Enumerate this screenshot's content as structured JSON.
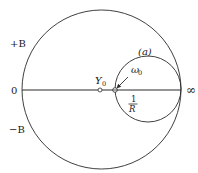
{
  "diagram": {
    "colors": {
      "stroke": "#2a2a2a",
      "text": "#1a1a1a",
      "background": "#ffffff"
    },
    "outer_circle": {
      "cx": 101.5,
      "cy": 89.5,
      "r": 79.5
    },
    "inner_circle": {
      "cx": 148,
      "cy": 89,
      "r": 33,
      "label": "(a)"
    },
    "axis": {
      "x1": 22,
      "x2": 181,
      "y": 90
    },
    "labels": {
      "plus_b": "+B",
      "zero": "0",
      "minus_b": "−B",
      "infinity": "∞",
      "y0_main": "Y",
      "y0_sub": "0",
      "omega0_main": "ω",
      "omega0_sub": "0",
      "frac_num": "1",
      "frac_den": "R"
    },
    "points": {
      "y0": {
        "cx": 100,
        "cy": 90
      },
      "omega0": {
        "cx": 115,
        "cy": 90
      }
    }
  }
}
